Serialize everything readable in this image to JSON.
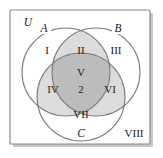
{
  "figure": {
    "type": "venn-diagram-3-set",
    "universe_label": "U",
    "frame": {
      "border_color": "#8a8a8a",
      "shadow_color": "#c8c8c8",
      "background": "#ffffff"
    },
    "circle_stroke_color": "#7d7d7d",
    "shading": {
      "light_fill": "#dcdcdc",
      "dark_fill": "#bcbcbc",
      "unshaded_fill": "#ffffff"
    }
  },
  "sets": [
    {
      "id": "A",
      "label": "A"
    },
    {
      "id": "B",
      "label": "B"
    },
    {
      "id": "C",
      "label": "C"
    }
  ],
  "regions": [
    {
      "id": "I",
      "label": "I",
      "shaded": "none",
      "description": "A only"
    },
    {
      "id": "II",
      "label": "II",
      "shaded": "light",
      "description": "A and B only"
    },
    {
      "id": "III",
      "label": "III",
      "shaded": "none",
      "description": "B only"
    },
    {
      "id": "IV",
      "label": "IV",
      "shaded": "light",
      "description": "A and C only"
    },
    {
      "id": "V",
      "label": "V",
      "shaded": "dark",
      "description": "A and B and C"
    },
    {
      "id": "VI",
      "label": "VI",
      "shaded": "light",
      "description": "B and C only"
    },
    {
      "id": "VII",
      "label": "VII",
      "shaded": "none",
      "description": "C only"
    },
    {
      "id": "VIII",
      "label": "VIII",
      "shaded": "none",
      "description": "outside all sets"
    }
  ],
  "annotations": [
    {
      "id": "center-count",
      "label": "2",
      "region": "V"
    }
  ]
}
